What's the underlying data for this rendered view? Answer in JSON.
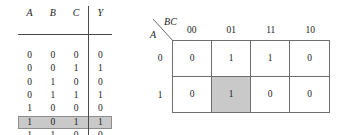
{
  "truth_table": {
    "headers": [
      "A",
      "B",
      "C",
      "Y"
    ],
    "rows": [
      {
        "A": "0",
        "B": "0",
        "C": "0",
        "Y": "0",
        "highlighted": false
      },
      {
        "A": "0",
        "B": "0",
        "C": "1",
        "Y": "1",
        "highlighted": false
      },
      {
        "A": "0",
        "B": "1",
        "C": "0",
        "Y": "0",
        "highlighted": false
      },
      {
        "A": "0",
        "B": "1",
        "C": "1",
        "Y": "1",
        "highlighted": false
      },
      {
        "A": "1",
        "B": "0",
        "C": "0",
        "Y": "0",
        "highlighted": false
      },
      {
        "A": "1",
        "B": "0",
        "C": "1",
        "Y": "1",
        "highlighted": true
      },
      {
        "A": "1",
        "B": "1",
        "C": "0",
        "Y": "0",
        "highlighted": false
      },
      {
        "A": "1",
        "B": "1",
        "C": "1",
        "Y": "0",
        "highlighted": false
      }
    ]
  },
  "kmap": {
    "col_variable_label": "BC",
    "row_variable_label": "A",
    "column_headers": [
      "00",
      "01",
      "11",
      "10"
    ],
    "row_headers": [
      "0",
      "1"
    ],
    "cells": [
      [
        {
          "value": "0",
          "shaded": false
        },
        {
          "value": "1",
          "shaded": false
        },
        {
          "value": "1",
          "shaded": false
        },
        {
          "value": "0",
          "shaded": false
        }
      ],
      [
        {
          "value": "0",
          "shaded": false
        },
        {
          "value": "1",
          "shaded": true
        },
        {
          "value": "0",
          "shaded": false
        },
        {
          "value": "0",
          "shaded": false
        }
      ]
    ]
  },
  "colors": {
    "highlight_fill": "#c9c9c9",
    "highlight_border": "#8d8d8d",
    "grid_line": "#6e6e6e",
    "rule_line": "#4a4a4a",
    "text": "#232323"
  }
}
